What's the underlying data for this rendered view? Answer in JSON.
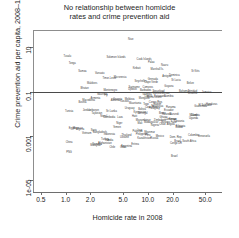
{
  "chart_data": {
    "type": "scatter",
    "title": "No relationship between homicide rates and crime prevention aid",
    "title_lines": [
      "No relationship between homicide",
      "rates and crime prevention aid"
    ],
    "xlabel": "Homicide rate in 2008",
    "ylabel": "Crime prevention aid per capita, 2008–10 ($)",
    "xscale": "log",
    "yscale": "log",
    "xlim": [
      0.4,
      80
    ],
    "ylim": [
      3e-06,
      60
    ],
    "xticks": [
      0.5,
      1.0,
      2.0,
      5.0,
      10.0,
      20.0,
      50.0
    ],
    "xticklabels": [
      "0.5",
      "1.0",
      "2.0",
      "5.0",
      "10.0",
      "20.0",
      "50.0"
    ],
    "yticks": [
      1e-05,
      0.001,
      0.1,
      10
    ],
    "yticklabels": [
      "1e-05",
      "0.001",
      "0.1",
      "10"
    ],
    "grid": false,
    "legend": null,
    "annotations": [
      {
        "type": "hline",
        "y": 0.1,
        "label": "reference line"
      }
    ],
    "marker": "text-label",
    "points": [
      {
        "label": "Niue",
        "x": 6.2,
        "y": 21.0
      },
      {
        "label": "Tuvalu",
        "x": 1.05,
        "y": 3.6
      },
      {
        "label": "Tonga",
        "x": 1.2,
        "y": 1.7
      },
      {
        "label": "Solomon Islands",
        "x": 4.1,
        "y": 3.4
      },
      {
        "label": "Samoa",
        "x": 1.6,
        "y": 0.74
      },
      {
        "label": "Vanuatu",
        "x": 2.6,
        "y": 0.62
      },
      {
        "label": "Palau",
        "x": 11.0,
        "y": 2.0
      },
      {
        "label": "Kiribati",
        "x": 7.3,
        "y": 1.1
      },
      {
        "label": "Nauru",
        "x": 16.0,
        "y": 1.5
      },
      {
        "label": "Cook Islands",
        "x": 9.0,
        "y": 2.6
      },
      {
        "label": "Marshall Is.",
        "x": 13.0,
        "y": 0.95
      },
      {
        "label": "Micronesia",
        "x": 4.6,
        "y": 0.41
      },
      {
        "label": "Timor-Leste",
        "x": 3.4,
        "y": 0.36
      },
      {
        "label": "Dominica",
        "x": 21.0,
        "y": 0.52
      },
      {
        "label": "St Kitts",
        "x": 38.0,
        "y": 0.8
      },
      {
        "label": "Grenada",
        "x": 11.5,
        "y": 0.34
      },
      {
        "label": "St Lucia",
        "x": 22.0,
        "y": 0.3
      },
      {
        "label": "Antigua",
        "x": 17.0,
        "y": 0.44
      },
      {
        "label": "Seychelles",
        "x": 8.2,
        "y": 0.27
      },
      {
        "label": "Maldives",
        "x": 2.1,
        "y": 0.21
      },
      {
        "label": "Cape Verde",
        "x": 11.0,
        "y": 0.24
      },
      {
        "label": "Belize",
        "x": 33.0,
        "y": 0.22
      },
      {
        "label": "Guyana",
        "x": 18.0,
        "y": 0.17
      },
      {
        "label": "Suriname",
        "x": 6.8,
        "y": 0.15
      },
      {
        "label": "Bhutan",
        "x": 1.7,
        "y": 0.13
      },
      {
        "label": "Djibouti",
        "x": 6.5,
        "y": 0.12
      },
      {
        "label": "Comoros",
        "x": 10.0,
        "y": 0.14
      },
      {
        "label": "Barbados",
        "x": 9.4,
        "y": 0.11
      },
      {
        "label": "Montenegro",
        "x": 3.5,
        "y": 0.105
      },
      {
        "label": "Bahamas",
        "x": 28.0,
        "y": 0.1
      },
      {
        "label": "Trinidad",
        "x": 35.0,
        "y": 0.095
      },
      {
        "label": "Jamaica",
        "x": 52.0,
        "y": 0.088
      },
      {
        "label": "Swaziland",
        "x": 13.5,
        "y": 0.092
      },
      {
        "label": "Guinea-Bissau",
        "x": 14.5,
        "y": 0.082
      },
      {
        "label": "Lesotho",
        "x": 35.0,
        "y": 0.078
      },
      {
        "label": "Gambia",
        "x": 9.8,
        "y": 0.072
      },
      {
        "label": "Mauritius",
        "x": 2.8,
        "y": 0.068
      },
      {
        "label": "Fiji",
        "x": 3.1,
        "y": 0.064
      },
      {
        "label": "Namibia",
        "x": 18.0,
        "y": 0.06
      },
      {
        "label": "Botswana",
        "x": 14.0,
        "y": 0.058
      },
      {
        "label": "Liberia",
        "x": 10.2,
        "y": 0.055
      },
      {
        "label": "Sierra Leone",
        "x": 12.0,
        "y": 0.052
      },
      {
        "label": "Mongolia",
        "x": 9.0,
        "y": 0.048
      },
      {
        "label": "Armenia",
        "x": 2.3,
        "y": 0.045
      },
      {
        "label": "Georgia",
        "x": 4.3,
        "y": 0.042
      },
      {
        "label": "Moldova",
        "x": 6.0,
        "y": 0.04
      },
      {
        "label": "Albania",
        "x": 4.0,
        "y": 0.038
      },
      {
        "label": "Macedonia",
        "x": 1.9,
        "y": 0.036
      },
      {
        "label": "Kosovo",
        "x": 5.2,
        "y": 0.034
      },
      {
        "label": "Bosnia",
        "x": 1.6,
        "y": 0.032
      },
      {
        "label": "Congo Rep.",
        "x": 12.5,
        "y": 0.03
      },
      {
        "label": "Mauritania",
        "x": 7.0,
        "y": 0.028
      },
      {
        "label": "Gabon",
        "x": 13.0,
        "y": 0.026
      },
      {
        "label": "Togo",
        "x": 9.5,
        "y": 0.025
      },
      {
        "label": "Honduras",
        "x": 60.0,
        "y": 0.024
      },
      {
        "label": "El Salvador",
        "x": 50.0,
        "y": 0.022
      },
      {
        "label": "Guatemala",
        "x": 44.0,
        "y": 0.021
      },
      {
        "label": "Nicaragua",
        "x": 13.0,
        "y": 0.02
      },
      {
        "label": "Panama",
        "x": 19.0,
        "y": 0.019
      },
      {
        "label": "Costa Rica",
        "x": 11.0,
        "y": 0.018
      },
      {
        "label": "Paraguay",
        "x": 12.0,
        "y": 0.017
      },
      {
        "label": "Uruguay",
        "x": 6.0,
        "y": 0.016
      },
      {
        "label": "Bolivia",
        "x": 8.5,
        "y": 0.015
      },
      {
        "label": "Ecuador",
        "x": 18.0,
        "y": 0.014
      },
      {
        "label": "Jordan",
        "x": 1.8,
        "y": 0.013
      },
      {
        "label": "Lebanon",
        "x": 2.2,
        "y": 0.013
      },
      {
        "label": "Tunisia",
        "x": 1.1,
        "y": 0.012
      },
      {
        "label": "Sri Lanka",
        "x": 3.6,
        "y": 0.012
      },
      {
        "label": "Kyrgyzstan",
        "x": 8.0,
        "y": 0.011
      },
      {
        "label": "Tajikistan",
        "x": 2.4,
        "y": 0.01
      },
      {
        "label": "Senegal",
        "x": 8.7,
        "y": 0.01
      },
      {
        "label": "Benin",
        "x": 15.0,
        "y": 0.0095
      },
      {
        "label": "Rwanda",
        "x": 17.0,
        "y": 0.009
      },
      {
        "label": "Burundi",
        "x": 21.0,
        "y": 0.0085
      },
      {
        "label": "Malawi",
        "x": 36.0,
        "y": 0.0082
      },
      {
        "label": "Zambia",
        "x": 38.0,
        "y": 0.0078
      },
      {
        "label": "Haiti",
        "x": 6.9,
        "y": 0.0075
      },
      {
        "label": "Nepal",
        "x": 2.9,
        "y": 0.0072
      },
      {
        "label": "Cambodia",
        "x": 3.4,
        "y": 0.0068
      },
      {
        "label": "Laos",
        "x": 4.6,
        "y": 0.0065
      },
      {
        "label": "Ghana",
        "x": 15.5,
        "y": 0.0062
      },
      {
        "label": "Uganda",
        "x": 36.0,
        "y": 0.0058
      },
      {
        "label": "Kenya",
        "x": 20.0,
        "y": 0.0055
      },
      {
        "label": "Cameroon",
        "x": 19.0,
        "y": 0.0052
      },
      {
        "label": "Zimbabwe",
        "x": 14.0,
        "y": 0.005
      },
      {
        "label": "Mozambique",
        "x": 8.8,
        "y": 0.0046
      },
      {
        "label": "Tanzania",
        "x": 24.0,
        "y": 0.0042
      },
      {
        "label": "Madagascar",
        "x": 11.0,
        "y": 0.004
      },
      {
        "label": "Burkina Faso",
        "x": 18.0,
        "y": 0.0038
      },
      {
        "label": "Mali",
        "x": 8.0,
        "y": 0.0036
      },
      {
        "label": "Niger",
        "x": 4.5,
        "y": 0.0034
      },
      {
        "label": "Chad",
        "x": 15.0,
        "y": 0.0032
      },
      {
        "label": "Angola",
        "x": 19.0,
        "y": 0.003
      },
      {
        "label": "Nigeria",
        "x": 12.2,
        "y": 0.0028
      },
      {
        "label": "Ethiopia",
        "x": 25.0,
        "y": 0.0026
      },
      {
        "label": "Sudan",
        "x": 24.0,
        "y": 0.0024
      },
      {
        "label": "Yemen",
        "x": 4.2,
        "y": 0.0022
      },
      {
        "label": "Morocco",
        "x": 1.4,
        "y": 0.0021
      },
      {
        "label": "Egypt",
        "x": 1.2,
        "y": 0.002
      },
      {
        "label": "Algeria",
        "x": 1.5,
        "y": 0.0018
      },
      {
        "label": "Syria",
        "x": 2.2,
        "y": 0.0017
      },
      {
        "label": "Iraq",
        "x": 8.0,
        "y": 0.0016
      },
      {
        "label": "Pakistan",
        "x": 7.5,
        "y": 0.0015
      },
      {
        "label": "Bangladesh",
        "x": 2.6,
        "y": 0.0014
      },
      {
        "label": "Myanmar",
        "x": 10.5,
        "y": 0.0013
      },
      {
        "label": "Vietnam",
        "x": 1.8,
        "y": 0.0012
      },
      {
        "label": "Indonesia",
        "x": 3.4,
        "y": 0.0011
      },
      {
        "label": "Philippines",
        "x": 8.5,
        "y": 0.0011
      },
      {
        "label": "Thailand",
        "x": 5.5,
        "y": 0.001
      },
      {
        "label": "Peru",
        "x": 10.0,
        "y": 0.001
      },
      {
        "label": "Colombia",
        "x": 36.0,
        "y": 0.001
      },
      {
        "label": "Venezuela",
        "x": 48.0,
        "y": 0.00095
      },
      {
        "label": "Mexico",
        "x": 14.0,
        "y": 0.0009
      },
      {
        "label": "Dom. Rep.",
        "x": 22.0,
        "y": 0.00085
      },
      {
        "label": "Ukraine",
        "x": 5.2,
        "y": 0.0008
      },
      {
        "label": "Russia",
        "x": 12.0,
        "y": 0.00075
      },
      {
        "label": "Kazakhstan",
        "x": 9.0,
        "y": 0.0007
      },
      {
        "label": "Turkey",
        "x": 3.0,
        "y": 0.00065
      },
      {
        "label": "Iran",
        "x": 3.2,
        "y": 0.0006
      },
      {
        "label": "India",
        "x": 3.5,
        "y": 0.00058
      },
      {
        "label": "South Africa",
        "x": 32.0,
        "y": 0.00055
      },
      {
        "label": "Brazil",
        "x": 23.0,
        "y": 0.00052
      },
      {
        "label": "China",
        "x": 1.1,
        "y": 0.00048
      },
      {
        "label": "Afghanistan",
        "x": 3.0,
        "y": 0.00045
      },
      {
        "label": "Congo DR",
        "x": 22.0,
        "y": 0.00042
      },
      {
        "label": "Somalia",
        "x": 2.4,
        "y": 0.0004
      },
      {
        "label": "Eritrea",
        "x": 7.0,
        "y": 0.00038
      },
      {
        "label": "Malaysia",
        "x": 2.3,
        "y": 0.00035
      },
      {
        "label": "Argentina",
        "x": 5.5,
        "y": 0.00032
      },
      {
        "label": "Chile",
        "x": 3.7,
        "y": 0.0003
      },
      {
        "label": "Cuba",
        "x": 5.0,
        "y": 0.00028
      },
      {
        "label": "PNG",
        "x": 1.1,
        "y": 0.00018
      },
      {
        "label": "Brazil",
        "x": 21.0,
        "y": 0.00011
      }
    ]
  }
}
